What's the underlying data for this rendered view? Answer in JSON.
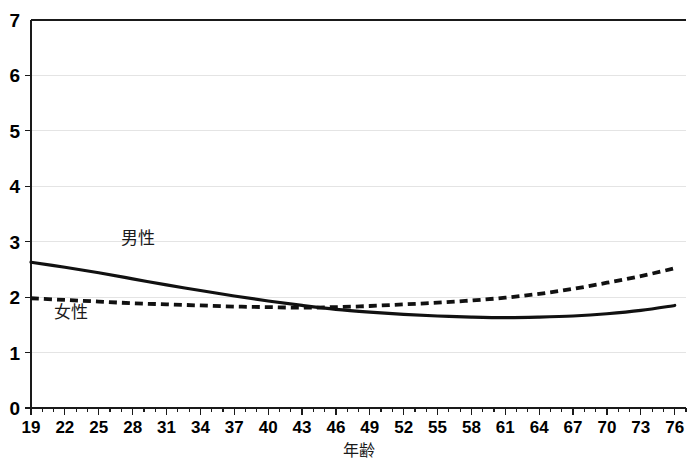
{
  "chart_data": {
    "type": "line",
    "title": "",
    "xlabel": "年齢",
    "ylabel": "",
    "xlim": [
      19,
      77
    ],
    "ylim": [
      0,
      7
    ],
    "grid": true,
    "legend_position": "inline-annotation",
    "x_tick_labels": [
      "19",
      "22",
      "25",
      "28",
      "31",
      "34",
      "37",
      "40",
      "43",
      "46",
      "49",
      "52",
      "55",
      "58",
      "61",
      "64",
      "67",
      "70",
      "73",
      "76"
    ],
    "y_tick_labels": [
      "0",
      "1",
      "2",
      "3",
      "4",
      "5",
      "6",
      "7"
    ],
    "x": [
      19,
      22,
      25,
      28,
      31,
      34,
      37,
      40,
      43,
      46,
      49,
      52,
      55,
      58,
      61,
      64,
      67,
      70,
      73,
      76
    ],
    "series": [
      {
        "name": "男性",
        "style": "solid",
        "color": "#111111",
        "label_x": 27,
        "label_y": 2.95,
        "values": [
          2.63,
          2.54,
          2.44,
          2.33,
          2.22,
          2.12,
          2.02,
          1.93,
          1.85,
          1.78,
          1.73,
          1.69,
          1.66,
          1.64,
          1.63,
          1.64,
          1.66,
          1.7,
          1.76,
          1.85
        ]
      },
      {
        "name": "女性",
        "style": "dashed",
        "color": "#111111",
        "label_x": 21,
        "label_y": 1.62,
        "values": [
          1.98,
          1.95,
          1.92,
          1.89,
          1.87,
          1.85,
          1.83,
          1.82,
          1.81,
          1.82,
          1.84,
          1.87,
          1.9,
          1.94,
          1.99,
          2.06,
          2.15,
          2.26,
          2.38,
          2.52
        ]
      }
    ]
  }
}
